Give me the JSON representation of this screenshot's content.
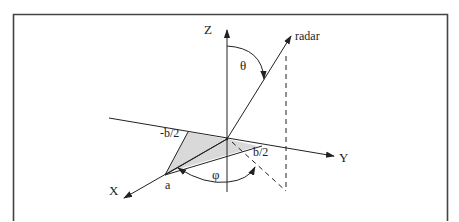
{
  "diagram": {
    "type": "3d-coordinate-geometry",
    "axes": {
      "x_label": "X",
      "y_label": "Y",
      "z_label": "Z"
    },
    "vectors": {
      "radar_label": "radar"
    },
    "angles": {
      "theta_label": "θ",
      "phi_label": "φ"
    },
    "points": {
      "a_label": "a",
      "neg_half_b_label": "-b/2",
      "pos_half_b_label": "b/2"
    },
    "colors": {
      "line": "#222222",
      "shade": "#d9d9d9",
      "frame": "#444444",
      "background": "#ffffff"
    }
  }
}
